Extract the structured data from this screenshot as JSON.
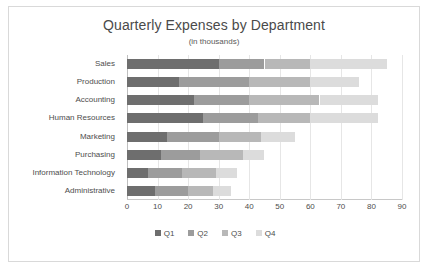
{
  "chart_data": {
    "type": "bar",
    "orientation": "horizontal",
    "stacked": true,
    "title": "Quarterly Expenses by Department",
    "subtitle": "(in thousands)",
    "xlabel": "",
    "ylabel": "",
    "xlim": [
      0,
      90
    ],
    "xticks": [
      0,
      10,
      20,
      30,
      40,
      50,
      60,
      70,
      80,
      90
    ],
    "grid": true,
    "legend_position": "bottom",
    "categories": [
      "Sales",
      "Production",
      "Accounting",
      "Human Resources",
      "Marketing",
      "Purchasing",
      "Information Technology",
      "Administrative"
    ],
    "series": [
      {
        "name": "Q1",
        "color": "#6e6e6e",
        "values": [
          30,
          17,
          22,
          25,
          13,
          11,
          7,
          9
        ]
      },
      {
        "name": "Q2",
        "color": "#9c9c9c",
        "values": [
          15,
          23,
          18,
          18,
          17,
          13,
          11,
          11
        ]
      },
      {
        "name": "Q3",
        "color": "#b8b8b8",
        "values": [
          15,
          20,
          23,
          17,
          14,
          14,
          11,
          8
        ]
      },
      {
        "name": "Q4",
        "color": "#dcdcdc",
        "values": [
          25,
          16,
          19,
          22,
          11,
          7,
          7,
          6
        ]
      }
    ],
    "totals": [
      85,
      76,
      82,
      82,
      55,
      45,
      36,
      34
    ]
  },
  "colors": {
    "border": "#d9d9d9",
    "gridline": "#e6e6e6",
    "axis": "#bfbfbf",
    "text": "#4d4d4d",
    "title_text": "#4a4a4a",
    "background": "#ffffff"
  }
}
